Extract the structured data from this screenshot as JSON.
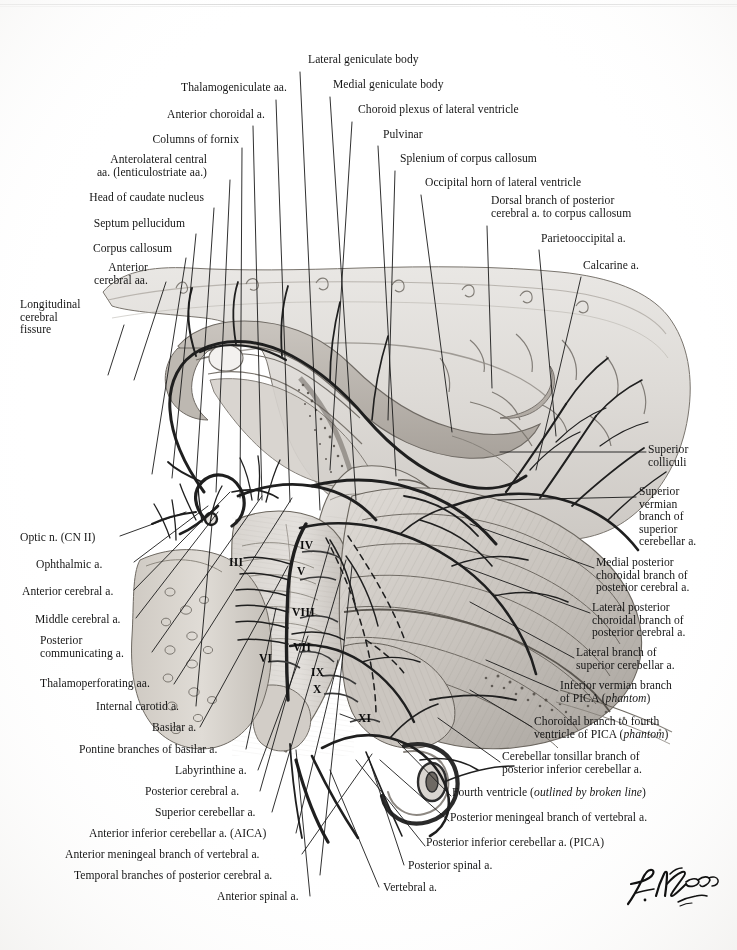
{
  "figure": {
    "signature": "F. Netter M.D.",
    "background_color": "#ffffff",
    "ink_color": "#161616"
  },
  "labels_top_left": [
    {
      "text": "Thalamogeniculate aa.",
      "x": 287,
      "y": 88
    },
    {
      "text": "Anterior choroidal a.",
      "x": 265,
      "y": 115
    },
    {
      "text": "Columns of fornix",
      "x": 239,
      "y": 140
    },
    {
      "text": "Anterolateral central\naa. (lenticulostriate aa.)",
      "x": 209,
      "y": 159
    },
    {
      "text": "Head of caudate nucleus",
      "x": 202,
      "y": 198
    },
    {
      "text": "Septum pellucidum",
      "x": 182,
      "y": 224
    },
    {
      "text": "Corpus callosum",
      "x": 170,
      "y": 249
    },
    {
      "text": "Anterior\ncerebral aa.",
      "x": 145,
      "y": 268
    },
    {
      "text": "Longitudinal\ncerebral\nfissure",
      "x": 78,
      "y": 305
    }
  ],
  "labels_top_right": [
    {
      "text": "Lateral geniculate body",
      "x": 308,
      "y": 60
    },
    {
      "text": "Medial geniculate body",
      "x": 333,
      "y": 85
    },
    {
      "text": "Choroid plexus of lateral ventricle",
      "x": 360,
      "y": 110
    },
    {
      "text": "Pulvinar",
      "x": 383,
      "y": 135
    },
    {
      "text": "Splenium of corpus callosum",
      "x": 400,
      "y": 159
    },
    {
      "text": "Occipital horn of lateral ventricle",
      "x": 426,
      "y": 183
    },
    {
      "text": "Dorsal branch of posterior\ncerebral a. to corpus callosum",
      "x": 492,
      "y": 201
    },
    {
      "text": "Parietooccipital a.",
      "x": 542,
      "y": 239
    },
    {
      "text": "Calcarine a.",
      "x": 584,
      "y": 266
    }
  ],
  "labels_right": [
    {
      "text": "Superior\ncolliculi",
      "x": 648,
      "y": 450
    },
    {
      "text": "Superior\nvermian\nbranch of\nsuperior\ncerebellar a.",
      "x": 639,
      "y": 492
    },
    {
      "text": "Medial posterior\nchoroidal branch of\nposterior cerebral a.",
      "x": 596,
      "y": 563
    },
    {
      "text": "Lateral posterior\nchoroidal branch of\nposterior cerebral a.",
      "x": 592,
      "y": 608
    },
    {
      "text": "Lateral branch of\nsuperior cerebellar a.",
      "x": 576,
      "y": 653
    },
    {
      "text": "Inferior vermian branch\nof PICA (phantom)",
      "x": 560,
      "y": 686,
      "italic_tail": "phantom"
    },
    {
      "text": "Choroidal branch to fourth\nventricle of PICA (phantom)",
      "x": 534,
      "y": 722,
      "italic_tail": "phantom"
    },
    {
      "text": "Cerebellar tonsillar branch of\nposterior inferior cerebellar a.",
      "x": 502,
      "y": 757
    },
    {
      "text": "Fourth ventricle (outlined by broken line)",
      "x": 453,
      "y": 793,
      "italic_tail": "outlined by broken line"
    },
    {
      "text": "Posterior meningeal branch of vertebral a.",
      "x": 451,
      "y": 818
    },
    {
      "text": "Posterior inferior cerebellar a. (PICA)",
      "x": 427,
      "y": 843
    }
  ],
  "labels_left": [
    {
      "text": "Optic n. (CN II)",
      "x": 20,
      "y": 538
    },
    {
      "text": "Ophthalmic a.",
      "x": 36,
      "y": 565
    },
    {
      "text": "Anterior cerebral a.",
      "x": 22,
      "y": 592
    },
    {
      "text": "Middle cerebral a.",
      "x": 35,
      "y": 620
    },
    {
      "text": "Posterior\ncommunicating a.",
      "x": 40,
      "y": 641
    },
    {
      "text": "Thalamoperforating aa.",
      "x": 40,
      "y": 684
    },
    {
      "text": "Internal carotid a.",
      "x": 96,
      "y": 707
    },
    {
      "text": "Basilar a.",
      "x": 152,
      "y": 728
    },
    {
      "text": "Pontine branches of basilar a.",
      "x": 79,
      "y": 750
    },
    {
      "text": "Labyrinthine a.",
      "x": 175,
      "y": 771
    },
    {
      "text": "Posterior cerebral a.",
      "x": 145,
      "y": 792
    },
    {
      "text": "Superior cerebellar a.",
      "x": 155,
      "y": 813
    },
    {
      "text": "Anterior inferior cerebellar a. (AICA)",
      "x": 89,
      "y": 834
    },
    {
      "text": "Anterior meningeal branch of vertebral a.",
      "x": 65,
      "y": 855
    },
    {
      "text": "Temporal branches of posterior cerebral a.",
      "x": 74,
      "y": 876
    },
    {
      "text": "Anterior spinal a.",
      "x": 217,
      "y": 897
    }
  ],
  "labels_bottom_right": [
    {
      "text": "Posterior spinal a.",
      "x": 408,
      "y": 866
    },
    {
      "text": "Vertebral a.",
      "x": 383,
      "y": 888
    }
  ],
  "cranial_nerves": [
    {
      "numeral": "III",
      "x": 229,
      "y": 562
    },
    {
      "numeral": "IV",
      "x": 300,
      "y": 545
    },
    {
      "numeral": "V",
      "x": 297,
      "y": 571
    },
    {
      "numeral": "VIII",
      "x": 292,
      "y": 612
    },
    {
      "numeral": "VII",
      "x": 293,
      "y": 647
    },
    {
      "numeral": "VI",
      "x": 259,
      "y": 658
    },
    {
      "numeral": "IX",
      "x": 311,
      "y": 672
    },
    {
      "numeral": "X",
      "x": 313,
      "y": 689
    },
    {
      "numeral": "XI",
      "x": 358,
      "y": 718
    }
  ]
}
